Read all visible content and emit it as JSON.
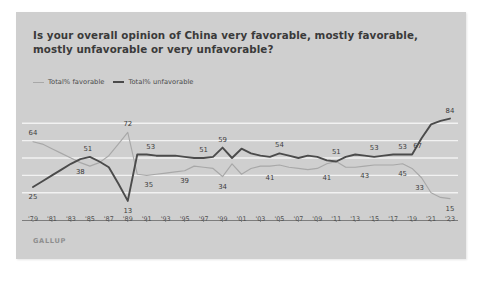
{
  "card": {
    "title": "Is your overall opinion of China very favorable, mostly favorable, mostly unfavorable or very unfavorable?",
    "source": "GALLUP",
    "background_color": "#cfcfcf"
  },
  "legend": {
    "position": "top-left",
    "items": [
      {
        "label": "Total% favorable",
        "color": "#a8a8a8",
        "icon": "line-swatch-icon"
      },
      {
        "label": "Total% unfavorable",
        "color": "#4b4b4b",
        "icon": "line-swatch-icon"
      }
    ]
  },
  "chart_data": {
    "type": "line",
    "title": "Is your overall opinion of China very favorable, mostly favorable, mostly unfavorable or very unfavorable?",
    "xlabel": "",
    "ylabel": "",
    "ylim": [
      0,
      100
    ],
    "xlim": [
      1979,
      2023
    ],
    "grid": true,
    "gridlines_y": [
      20,
      35,
      50,
      65,
      80
    ],
    "tick_labels": [
      "'79",
      "'81",
      "'83",
      "'85",
      "'87",
      "'89",
      "'91",
      "'93",
      "'95",
      "'97",
      "'99",
      "'01",
      "'03",
      "'05",
      "'07",
      "'09",
      "'11",
      "'13",
      "'15",
      "'17",
      "'19",
      "'21",
      "'23"
    ],
    "tick_years": [
      1979,
      1981,
      1983,
      1985,
      1987,
      1989,
      1991,
      1993,
      1995,
      1997,
      1999,
      2001,
      2003,
      2005,
      2007,
      2009,
      2011,
      2013,
      2015,
      2017,
      2019,
      2021,
      2023
    ],
    "series": [
      {
        "name": "Total% favorable",
        "color": "#a8a8a8",
        "x": [
          1979,
          1980,
          1981,
          1982,
          1983,
          1984,
          1985,
          1986,
          1987,
          1988,
          1989,
          1990,
          1991,
          1992,
          1993,
          1994,
          1995,
          1996,
          1997,
          1998,
          1999,
          2000,
          2001,
          2002,
          2003,
          2004,
          2005,
          2006,
          2007,
          2008,
          2009,
          2010,
          2011,
          2012,
          2013,
          2014,
          2015,
          2016,
          2017,
          2018,
          2019,
          2020,
          2021,
          2022,
          2023
        ],
        "values": [
          64,
          62,
          58,
          54,
          50,
          46,
          43,
          46,
          52,
          62,
          72,
          36,
          35,
          36,
          37,
          38,
          39,
          43,
          42,
          41,
          34,
          45,
          36,
          41,
          43,
          43,
          44,
          42,
          41,
          40,
          41,
          45,
          47,
          42,
          42,
          43,
          44,
          44,
          44,
          45,
          41,
          33,
          20,
          16,
          15
        ]
      },
      {
        "name": "Total% unfavorable",
        "color": "#4b4b4b",
        "x": [
          1979,
          1980,
          1981,
          1982,
          1983,
          1984,
          1985,
          1986,
          1987,
          1988,
          1989,
          1990,
          1991,
          1992,
          1993,
          1994,
          1995,
          1996,
          1997,
          1998,
          1999,
          2000,
          2001,
          2002,
          2003,
          2004,
          2005,
          2006,
          2007,
          2008,
          2009,
          2010,
          2011,
          2012,
          2013,
          2014,
          2015,
          2016,
          2017,
          2018,
          2019,
          2020,
          2021,
          2022,
          2023
        ],
        "values": [
          25,
          30,
          35,
          40,
          45,
          49,
          51,
          47,
          42,
          28,
          13,
          53,
          53,
          52,
          52,
          52,
          51,
          50,
          50,
          51,
          59,
          50,
          58,
          54,
          52,
          51,
          54,
          52,
          50,
          52,
          51,
          48,
          47,
          51,
          53,
          52,
          51,
          52,
          53,
          53,
          53,
          67,
          79,
          82,
          84
        ]
      }
    ],
    "point_labels": [
      {
        "series": "Total% favorable",
        "year": 1979,
        "value": 64,
        "text": "64",
        "dx": 0,
        "dy": -9
      },
      {
        "series": "Total% favorable",
        "year": 1989,
        "value": 72,
        "text": "72",
        "dx": 0,
        "dy": -8
      },
      {
        "series": "Total% favorable",
        "year": 1991,
        "value": 35,
        "text": "35",
        "dx": 2,
        "dy": 10
      },
      {
        "series": "Total% favorable",
        "year": 1995,
        "value": 39,
        "text": "39",
        "dx": 0,
        "dy": 10
      },
      {
        "series": "Total% favorable",
        "year": 1999,
        "value": 34,
        "text": "34",
        "dx": 0,
        "dy": 10
      },
      {
        "series": "Total% favorable",
        "year": 2004,
        "value": 41,
        "text": "41",
        "dx": 0,
        "dy": 10
      },
      {
        "series": "Total% favorable",
        "year": 2010,
        "value": 41,
        "text": "41",
        "dx": 0,
        "dy": 10
      },
      {
        "series": "Total% favorable",
        "year": 2014,
        "value": 43,
        "text": "43",
        "dx": 0,
        "dy": 10
      },
      {
        "series": "Total% favorable",
        "year": 2018,
        "value": 45,
        "text": "45",
        "dx": 0,
        "dy": 10
      },
      {
        "series": "Total% favorable",
        "year": 2020,
        "value": 33,
        "text": "33",
        "dx": -2,
        "dy": 10
      },
      {
        "series": "Total% favorable",
        "year": 2023,
        "value": 15,
        "text": "15",
        "dx": 0,
        "dy": 10
      },
      {
        "series": "Total% unfavorable",
        "year": 1979,
        "value": 25,
        "text": "25",
        "dx": 0,
        "dy": 10
      },
      {
        "series": "Total% unfavorable",
        "year": 1984,
        "value": 49,
        "text": "38",
        "dx": 0,
        "dy": 13
      },
      {
        "series": "Total% unfavorable",
        "year": 1985,
        "value": 51,
        "text": "51",
        "dx": -2,
        "dy": -8
      },
      {
        "series": "Total% unfavorable",
        "year": 1989,
        "value": 13,
        "text": "13",
        "dx": 0,
        "dy": 10
      },
      {
        "series": "Total% unfavorable",
        "year": 1991,
        "value": 53,
        "text": "53",
        "dx": 4,
        "dy": -8
      },
      {
        "series": "Total% unfavorable",
        "year": 1997,
        "value": 50,
        "text": "51",
        "dx": 0,
        "dy": -8
      },
      {
        "series": "Total% unfavorable",
        "year": 1999,
        "value": 59,
        "text": "59",
        "dx": 0,
        "dy": -8
      },
      {
        "series": "Total% unfavorable",
        "year": 2005,
        "value": 54,
        "text": "54",
        "dx": 0,
        "dy": -8
      },
      {
        "series": "Total% unfavorable",
        "year": 2011,
        "value": 47,
        "text": "51",
        "dx": 0,
        "dy": -9
      },
      {
        "series": "Total% unfavorable",
        "year": 2015,
        "value": 51,
        "text": "53",
        "dx": 0,
        "dy": -9
      },
      {
        "series": "Total% unfavorable",
        "year": 2018,
        "value": 53,
        "text": "53",
        "dx": 0,
        "dy": -8
      },
      {
        "series": "Total% unfavorable",
        "year": 2020,
        "value": 67,
        "text": "67",
        "dx": -4,
        "dy": 8
      },
      {
        "series": "Total% unfavorable",
        "year": 2023,
        "value": 84,
        "text": "84",
        "dx": 0,
        "dy": -8
      }
    ]
  }
}
